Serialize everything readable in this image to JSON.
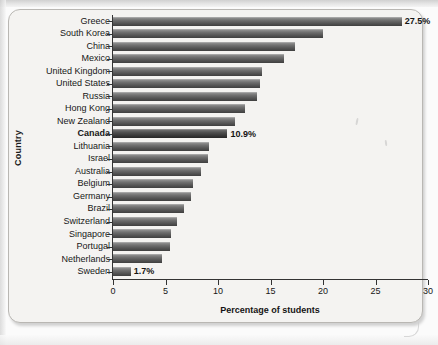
{
  "chart_data": {
    "type": "bar",
    "orientation": "horizontal",
    "title": "",
    "xlabel": "Percentage of students",
    "ylabel": "Country",
    "xlim": [
      0,
      30
    ],
    "xticks": [
      0,
      5,
      10,
      15,
      20,
      25,
      30
    ],
    "grid": false,
    "legend": null,
    "categories": [
      "Greece",
      "South Korea",
      "China",
      "Mexico",
      "United Kingdom",
      "United States",
      "Russia",
      "Hong Kong",
      "New Zealand",
      "Canada",
      "Lithuania",
      "Israel",
      "Australia",
      "Belgium",
      "Germany",
      "Brazil",
      "Switzerland",
      "Singapore",
      "Portugal",
      "Netherlands",
      "Sweden"
    ],
    "values": [
      27.5,
      20.0,
      17.3,
      16.3,
      14.2,
      14.0,
      13.7,
      12.6,
      11.6,
      10.9,
      9.1,
      9.0,
      8.4,
      7.6,
      7.4,
      6.8,
      6.1,
      5.5,
      5.4,
      4.7,
      1.7
    ],
    "annotations": [
      {
        "category": "Greece",
        "text": "27.5%"
      },
      {
        "category": "Canada",
        "text": "10.9%"
      },
      {
        "category": "Sweden",
        "text": "1.7%"
      }
    ],
    "highlighted_category": "Canada",
    "bar_color": "#5a5a5a",
    "highlight_color": "#2b2b2b"
  },
  "axis": {
    "x_title": "Percentage of students",
    "y_title": "Country",
    "x_tick_labels": [
      "0",
      "5",
      "10",
      "15",
      "20",
      "25",
      "30"
    ]
  }
}
